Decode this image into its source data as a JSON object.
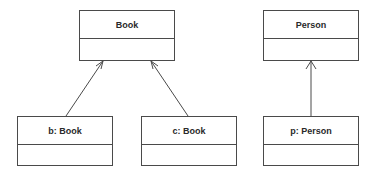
{
  "diagram": {
    "type": "UML object diagram",
    "classes": [
      {
        "id": "book",
        "name": "Book",
        "x": 79,
        "y": 10,
        "w": 96,
        "h": 51
      },
      {
        "id": "person",
        "name": "Person",
        "x": 263,
        "y": 10,
        "w": 96,
        "h": 51
      }
    ],
    "objects": [
      {
        "id": "b",
        "name": "b: Book",
        "x": 17,
        "y": 116,
        "w": 96,
        "h": 50
      },
      {
        "id": "c",
        "name": "c: Book",
        "x": 141,
        "y": 116,
        "w": 96,
        "h": 50
      },
      {
        "id": "p",
        "name": "p: Person",
        "x": 263,
        "y": 116,
        "w": 96,
        "h": 50
      }
    ],
    "links": [
      {
        "from": "b",
        "to": "book",
        "x1": 66,
        "y1": 116,
        "x2": 103,
        "y2": 61,
        "arrow": "open"
      },
      {
        "from": "c",
        "to": "book",
        "x1": 188,
        "y1": 116,
        "x2": 151,
        "y2": 61,
        "arrow": "open"
      },
      {
        "from": "p",
        "to": "person",
        "x1": 311,
        "y1": 116,
        "x2": 311,
        "y2": 61,
        "arrow": "open"
      }
    ],
    "line_color": "#4a4a4a"
  }
}
